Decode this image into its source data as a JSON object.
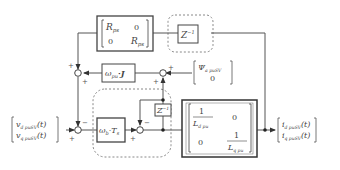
{
  "diagram": {
    "blocks": {
      "resistance": {
        "r11": "R",
        "r11_sub": "ps",
        "r12": "0",
        "r21": "0",
        "r22": "R",
        "r22_sub": "ps"
      },
      "delay_top": {
        "label": "Z",
        "exp": "−1"
      },
      "omega_j": {
        "label": "ω",
        "sub": "pu",
        "suffix": "·J"
      },
      "flux": {
        "top": "Ψ",
        "top_sub": "a puSV",
        "bottom": "0"
      },
      "omega_ts": {
        "label": "ω",
        "sub": "b",
        "mid": "·T",
        "sub2": "s"
      },
      "delay_inner": {
        "label": "Z",
        "exp": "−1"
      },
      "inductance": {
        "n11": "1",
        "d11": "L",
        "d11_sub": "d pu",
        "m12": "0",
        "m21": "0",
        "n22": "1",
        "d22": "L",
        "d22_sub": "q pu"
      }
    },
    "input": {
      "row1": "v",
      "row1_sub": "d puSV",
      "row1_arg": "(t)",
      "row2": "v",
      "row2_sub": "q puSV",
      "row2_arg": "(t)"
    },
    "output": {
      "row1": "i",
      "row1_sub": "d puSV",
      "row1_arg": "(t)",
      "row2": "i",
      "row2_sub": "q puSV",
      "row2_arg": "(t)"
    },
    "signs": {
      "plus": "+",
      "minus": "−"
    },
    "colors": {
      "line": "#555555",
      "block_border": "#444444",
      "dashed": "#888888"
    }
  }
}
